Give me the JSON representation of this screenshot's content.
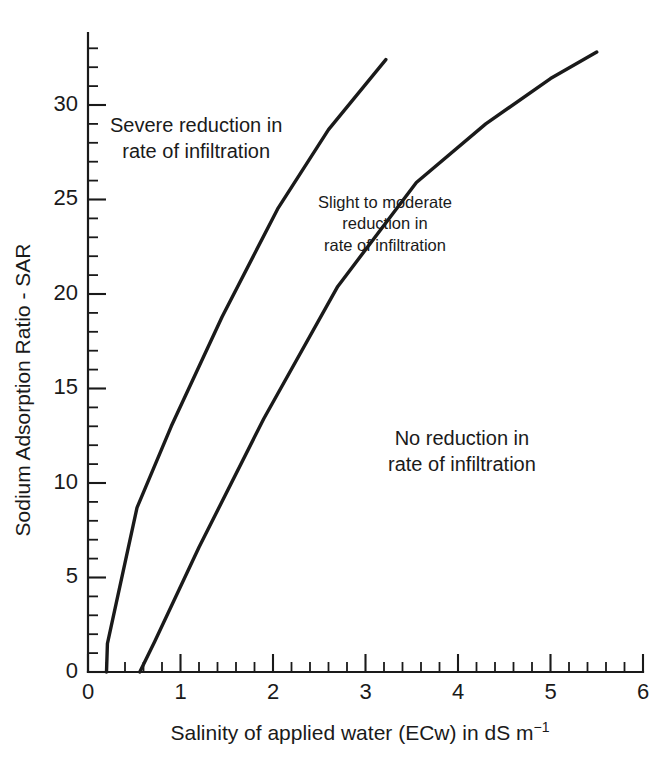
{
  "chart_data": {
    "type": "line",
    "title": "",
    "xlabel_plain": "Salinity of applied water (ECw) in dS m-1",
    "xlabel_main": "Salinity of applied water (ECw) in dS m",
    "xlabel_exponent": "−1",
    "ylabel": "Sodium Adsorption Ratio - SAR",
    "xlim": [
      0,
      6
    ],
    "ylim": [
      0,
      35
    ],
    "xticks": [
      0,
      1,
      2,
      3,
      4,
      5,
      6
    ],
    "xtick_labels": [
      "0",
      "1",
      "2",
      "3",
      "4",
      "5",
      "6"
    ],
    "x_minor_step": 0.2,
    "yticks": [
      0,
      5,
      10,
      15,
      20,
      25,
      30
    ],
    "ytick_labels": [
      "0",
      "5",
      "10",
      "15",
      "20",
      "25",
      "30"
    ],
    "y_minor_step": 1,
    "grid": false,
    "legend": false,
    "line_color": "#1a1a1a",
    "background": "#ffffff",
    "series": [
      {
        "name": "Severe / Slight-to-moderate boundary (upper curve)",
        "x": [
          0.2,
          0.21,
          0.53,
          0.9,
          1.45,
          2.05,
          2.6,
          3.22
        ],
        "y": [
          0.0,
          1.5,
          8.7,
          13.0,
          18.8,
          24.5,
          28.7,
          32.4
        ]
      },
      {
        "name": "Slight-to-moderate / No reduction boundary (lower curve)",
        "x": [
          0.56,
          0.72,
          1.2,
          1.9,
          2.7,
          3.55,
          4.3,
          5.0,
          5.5
        ],
        "y": [
          0.0,
          1.6,
          6.6,
          13.4,
          20.4,
          25.9,
          29.0,
          31.4,
          32.8
        ]
      }
    ],
    "annotations": [
      {
        "name": "severe-region",
        "lines": [
          "Severe reduction in",
          "rate of infiltration"
        ],
        "x": 0.85,
        "y": 28.0
      },
      {
        "name": "slight-moderate-region",
        "lines": [
          "Slight to moderate",
          "reduction in",
          "rate of infiltration"
        ],
        "x": 2.55,
        "y": 24.0
      },
      {
        "name": "no-reduction-region",
        "lines": [
          "No reduction in",
          "rate of infiltration"
        ],
        "x": 3.95,
        "y": 11.8
      }
    ]
  }
}
